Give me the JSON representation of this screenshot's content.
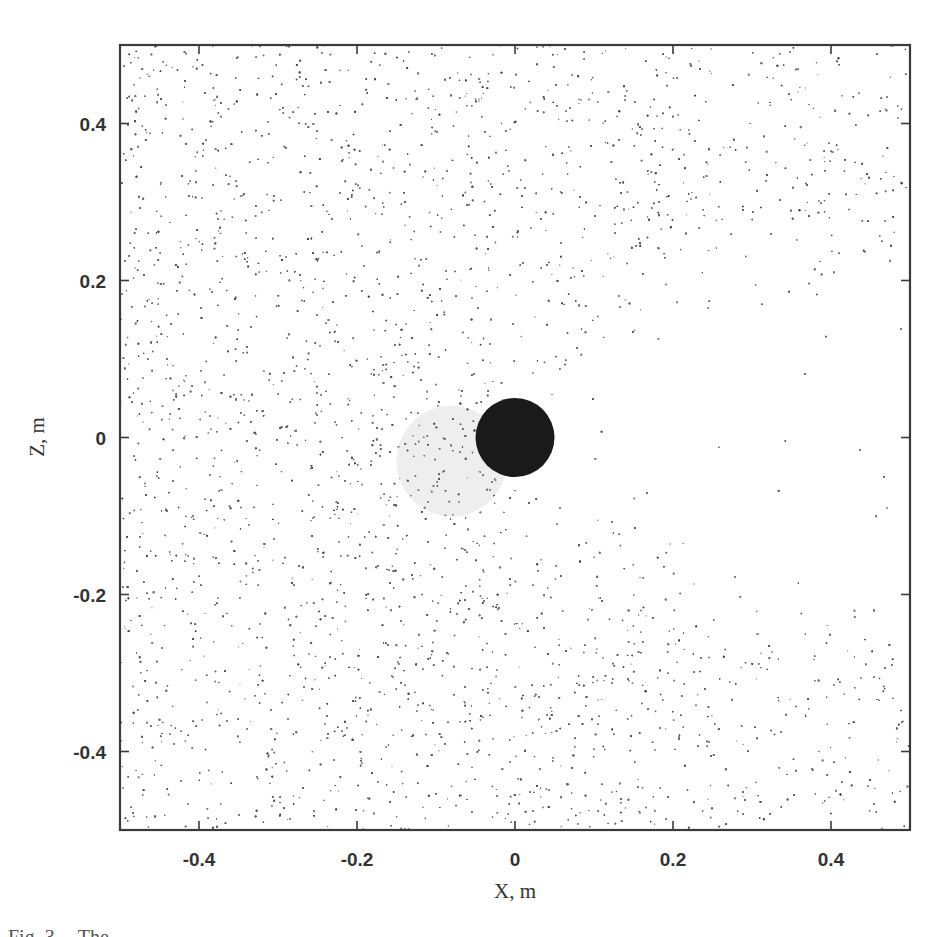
{
  "chart_data": {
    "type": "scatter",
    "title": "",
    "xlabel": "X, m",
    "ylabel": "Z, m",
    "xlim": [
      -0.5,
      0.5
    ],
    "ylim": [
      -0.5,
      0.5
    ],
    "x_ticks": [
      "-0.4",
      "-0.2",
      "0",
      "0.2",
      "0.4"
    ],
    "x_tick_values": [
      -0.4,
      -0.2,
      0,
      0.2,
      0.4
    ],
    "y_ticks": [
      "0.4",
      "0.2",
      "0",
      "-0.2",
      "-0.4"
    ],
    "y_tick_values": [
      0.4,
      0.2,
      0,
      -0.2,
      -0.4
    ],
    "grid": false,
    "legend": null,
    "series": [
      {
        "name": "particles",
        "kind": "dense random point cloud",
        "approx_count": 9000,
        "color": "#555555",
        "marker_size_px": 1.6,
        "description": "Uniform scatter over domain with depleted wake region downstream (x>0, |z|<0.2)"
      }
    ],
    "obstacle": {
      "shape": "circle",
      "center": [
        0,
        0
      ],
      "radius": 0.05,
      "color": "#1a1a1a"
    },
    "halo": {
      "shape": "circle",
      "center": [
        -0.08,
        -0.03
      ],
      "radius": 0.07,
      "color": "#eeeeee"
    },
    "wake": {
      "x_range": [
        0.0,
        0.5
      ],
      "z_range": [
        -0.22,
        0.22
      ],
      "relative_density": 0.08
    }
  },
  "caption": {
    "fig_label": "Fig. 3.",
    "text_start": "The"
  }
}
